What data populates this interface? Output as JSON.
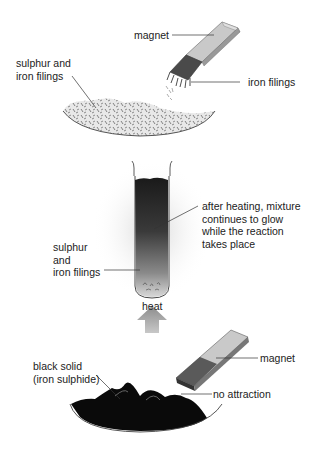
{
  "panel1": {
    "labels": {
      "magnet": "magnet",
      "mixture": "sulphur and\niron filings",
      "iron_filings": "iron filings"
    }
  },
  "panel2": {
    "labels": {
      "glow": "after heating, mixture\ncontinues to glow\nwhile the reaction\ntakes place",
      "mixture": "sulphur\nand\niron filings",
      "heat": "heat"
    }
  },
  "panel3": {
    "labels": {
      "black_solid": "black solid\n(iron sulphide)",
      "magnet": "magnet",
      "no_attraction": "no attraction"
    }
  },
  "colors": {
    "magnet_light": "#c9c9c9",
    "magnet_dark": "#555555",
    "iron_sulphide": "#0a0a0a",
    "heat_arrow": "#9a9a9a"
  }
}
